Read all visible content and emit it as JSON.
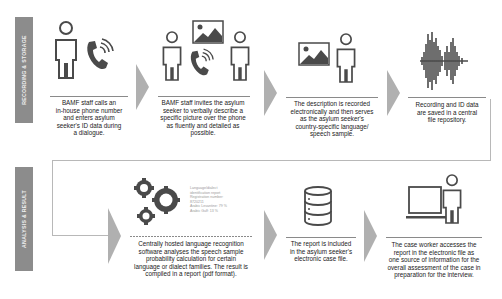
{
  "sections": [
    {
      "label": "RECORDING & STORAGE"
    },
    {
      "label": "ANALYSIS & RESULT"
    }
  ],
  "steps": [
    {
      "caption": [
        "BAMF staff calls an",
        "in-house phone number",
        "and enters asylum",
        "seeker's ID data during",
        "a dialogue."
      ],
      "icons": [
        "person-icon",
        "phone-icon"
      ]
    },
    {
      "caption": [
        "BAMF staff invites the asylum",
        "seeker to verbally describe a",
        "specific picture over the phone",
        "as fluently and detailed as",
        "possible."
      ],
      "icons": [
        "person-icon",
        "picture-icon",
        "phone-icon",
        "person-icon"
      ]
    },
    {
      "caption": [
        "The description is recorded",
        "electronically and then serves",
        "as the asylum seeker's",
        "country-specific language/",
        "speech sample."
      ],
      "icons": [
        "picture-icon",
        "person-icon"
      ]
    },
    {
      "caption": [
        "Recording and ID data",
        "are saved in a central",
        "file repository."
      ],
      "icons": [
        "soundwave-icon"
      ]
    },
    {
      "caption": [
        "Centrally hosted language recognition",
        "software analyses the speech sample",
        "probability calculation for certain",
        "language or dialect families. The result is",
        "compiled in a report (pdf format)."
      ],
      "icons": [
        "gears-icon"
      ]
    },
    {
      "caption": [
        "The report is included",
        "in the asylum seeker's",
        "electronic case file."
      ],
      "icons": [
        "database-icon"
      ]
    },
    {
      "caption": [
        "The case worker accesses the",
        "report in the electronic file as",
        "one source of information for the",
        "overall assessment of the case in",
        "preparation for the interview."
      ],
      "icons": [
        "laptop-icon",
        "person-icon"
      ]
    }
  ],
  "report": {
    "lines": [
      "Language/dialect",
      "identification report",
      "Registration number:",
      "8720211",
      "Arabic Levantine: 79 %",
      "Arabic Gulf: 13 %"
    ]
  },
  "colors": {
    "icon": "#4a4a4a",
    "band": "#8c8c8c",
    "chevron": "#b0b0b0",
    "frame": "#b8b8b8"
  }
}
